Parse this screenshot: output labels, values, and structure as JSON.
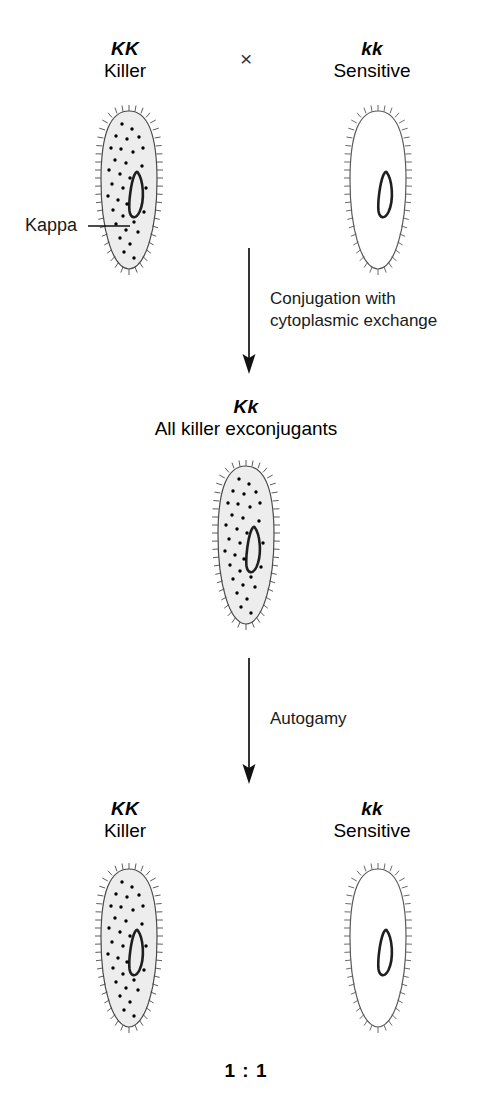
{
  "figure": {
    "title_row": {
      "parent1": {
        "genotype": "KK",
        "phenotype": "Killer"
      },
      "cross_symbol": "×",
      "parent2": {
        "genotype": "kk",
        "phenotype": "Sensitive"
      }
    },
    "annotations": {
      "kappa_label": "Kappa"
    },
    "step1": {
      "process_line1": "Conjugation with",
      "process_line2": "cytoplasmic exchange"
    },
    "f1": {
      "genotype": "Kk",
      "phenotype": "All killer exconjugants"
    },
    "step2": {
      "process_line1": "Autogamy"
    },
    "f2": {
      "left": {
        "genotype": "KK",
        "phenotype": "Killer"
      },
      "right": {
        "genotype": "kk",
        "phenotype": "Sensitive"
      }
    },
    "ratio": "1 : 1",
    "colors": {
      "ink": "#1a1a1a",
      "cytoplasm_fill": "#ededed",
      "membrane": "#555555",
      "kappa_particle": "#000000",
      "macronucleus": "#222222",
      "empty_fill": "#ffffff"
    }
  },
  "diagram_data": {
    "type": "genetic-cross-diagram",
    "organism": "Paramecium",
    "cells": [
      {
        "id": "p1",
        "genotype": "KK",
        "phenotype": "Killer",
        "kappa_particles": true,
        "cytoplasm": "shaded"
      },
      {
        "id": "p2",
        "genotype": "kk",
        "phenotype": "Sensitive",
        "kappa_particles": false,
        "cytoplasm": "clear"
      },
      {
        "id": "f1",
        "genotype": "Kk",
        "phenotype": "All killer exconjugants",
        "kappa_particles": true,
        "cytoplasm": "shaded"
      },
      {
        "id": "f2-left",
        "genotype": "KK",
        "phenotype": "Killer",
        "kappa_particles": true,
        "cytoplasm": "shaded"
      },
      {
        "id": "f2-right",
        "genotype": "kk",
        "phenotype": "Sensitive",
        "kappa_particles": false,
        "cytoplasm": "clear"
      }
    ],
    "steps": [
      "Conjugation with cytoplasmic exchange",
      "Autogamy"
    ],
    "outcome_ratio": "1 : 1"
  }
}
